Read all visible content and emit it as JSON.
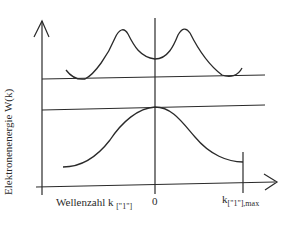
{
  "diagram": {
    "type": "band-structure",
    "y_axis_label": "Elektronenenergie W(k)",
    "x_axis_label_main": "Wellenzahl k",
    "x_axis_label_sub": "[\"1\"]",
    "x_tick_zero": "0",
    "x_tick_max_main": "k",
    "x_tick_max_sub": "[\"1\"],max",
    "curves": [
      {
        "name": "conduction-band",
        "description": "upper band with two peaks and minima at band edge line"
      },
      {
        "name": "valence-band",
        "description": "lower bell-shaped band with maximum at k=0"
      }
    ],
    "reference_lines": [
      "conduction-band-edge",
      "valence-band-edge"
    ],
    "line_color": "#2a2a2a"
  }
}
